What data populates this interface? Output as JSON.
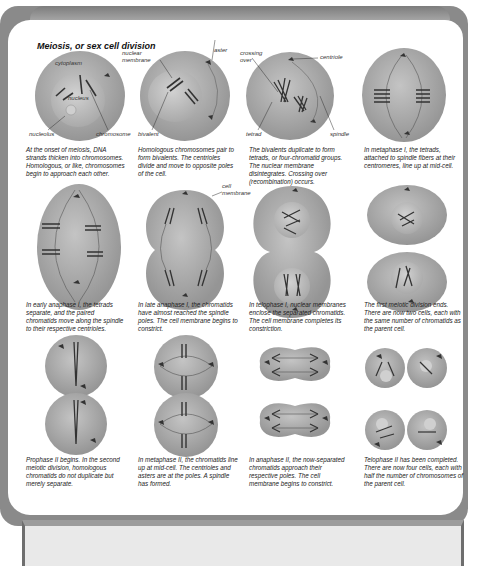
{
  "title": "Meiosis, or sex cell division",
  "colors": {
    "frame": "#8a8a8a",
    "cell_fill": "#a8a8a8",
    "nucleus_fill": "#bdbdbd",
    "chromosome": "#333333",
    "panel": "#ffffff"
  },
  "stages": [
    {
      "id": "prophase-1-early",
      "caption": "At the onset of meiosis, DNA strands thicken into chromosomes. Homologous, or like, chromosomes begin to approach each other.",
      "labels": {
        "cytoplasm": "cytoplasm",
        "nucleus": "nucleus",
        "nucleolus": "nucleolus",
        "chromosome": "chromosome"
      }
    },
    {
      "id": "prophase-1-bivalents",
      "caption": "Homologous chromosomes pair to form bivalents. The centrioles divide and move to opposite poles of the cell.",
      "labels": {
        "nuclear_membrane": "nuclear membrane",
        "aster": "aster",
        "bivalent": "bivalent"
      }
    },
    {
      "id": "prophase-1-tetrads",
      "caption": "The bivalents duplicate to form tetrads, or four-chromatid groups. The nuclear membrane disintegrates. Crossing over (recombination) occurs.",
      "labels": {
        "crossing_over": "crossing over",
        "centriole": "centriole",
        "tetrad": "tetrad",
        "spindle": "spindle"
      }
    },
    {
      "id": "metaphase-1",
      "caption": "In metaphase I, the tetrads, attached to spindle fibers at their centromeres, line up at mid-cell."
    },
    {
      "id": "anaphase-1-early",
      "caption": "In early anaphase I, the tetrads separate, and the paired chromatids move along the spindle to their respective centrioles."
    },
    {
      "id": "anaphase-1-late",
      "caption": "In late anaphase I, the chromatids have almost reached the spindle poles. The cell membrane begins to constrict.",
      "labels": {
        "cell_membrane": "cell membrane"
      }
    },
    {
      "id": "telophase-1",
      "caption": "In telophase I, nuclear membranes enclose the separated chromatids. The cell membrane completes its constriction."
    },
    {
      "id": "division-1-end",
      "caption": "The first meiotic division ends. There are now two cells, each with the same number of chromatids as the parent cell."
    },
    {
      "id": "prophase-2",
      "caption": "Prophase II begins. In the second meiotic division, homologous chromatids do not duplicate but merely separate."
    },
    {
      "id": "metaphase-2",
      "caption": "In metaphase II, the chromatids line up at mid-cell. The centrioles and asters are at the poles. A spindle has formed."
    },
    {
      "id": "anaphase-2",
      "caption": "In anaphase II, the now-separated chromatids approach their respective poles. The cell membrane begins to constrict."
    },
    {
      "id": "telophase-2",
      "caption": "Telophase II has been completed. There are now four cells, each with half the number of chromosomes of the parent cell."
    }
  ]
}
